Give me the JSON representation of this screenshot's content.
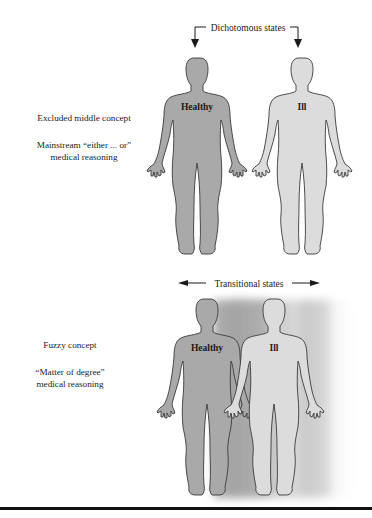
{
  "top_panel": {
    "arrow_label": "Dichotomous states",
    "left_text": {
      "concept": "Excluded middle concept",
      "reasoning_line1": "Mainstream “either ... or”",
      "reasoning_line2": "medical reasoning"
    },
    "figures": [
      {
        "label": "Healthy",
        "fill": "#a9a9a9"
      },
      {
        "label": "Ill",
        "fill": "#dcdcdc"
      }
    ]
  },
  "bottom_panel": {
    "arrow_label": "Transitional states",
    "left_text": {
      "concept": "Fuzzy concept",
      "reasoning_line1": "“Matter of degree”",
      "reasoning_line2": "medical reasoning"
    },
    "figures": [
      {
        "label": "Healthy",
        "fill": "#a9a9a9"
      },
      {
        "label": "Ill",
        "fill": "#dcdcdc"
      }
    ]
  },
  "colors": {
    "outline": "#3a3a3a",
    "text": "#1a1a1a",
    "rule": "#111111"
  }
}
